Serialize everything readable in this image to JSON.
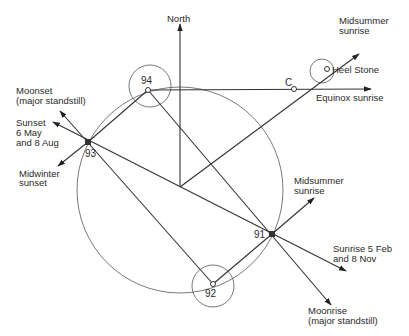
{
  "diagram": {
    "labels": {
      "north": "North",
      "midsummer_sunrise_top_1": "Midsummer",
      "midsummer_sunrise_top_2": "sunrise",
      "heel_stone": "Heel Stone",
      "c_point": "C",
      "equinox_sunrise": "Equinox sunrise",
      "moonset_1": "Moonset",
      "moonset_2": "(major standstill)",
      "sunset_1": "Sunset",
      "sunset_2": "6 May",
      "sunset_3": "and  8 Aug",
      "midwinter_sunset_1": "Midwinter",
      "midwinter_sunset_2": "sunset",
      "midsummer_sunrise_91_1": "Midsummer",
      "midsummer_sunrise_91_2": "sunrise",
      "sunrise_feb_1": "Sunrise 5 Feb",
      "sunrise_feb_2": "and  8 Nov",
      "moonrise_1": "Moonrise",
      "moonrise_2": "(major standstill)"
    },
    "stations": [
      {
        "id": "91",
        "label": "91"
      },
      {
        "id": "92",
        "label": "92"
      },
      {
        "id": "93",
        "label": "93"
      },
      {
        "id": "94",
        "label": "94"
      }
    ],
    "colors": {
      "line": "#333333",
      "background": "#ffffff"
    }
  }
}
